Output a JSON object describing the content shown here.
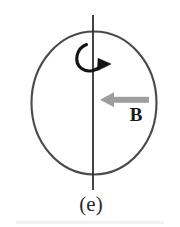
{
  "figure": {
    "panel_label": "(e)",
    "field_label": "B",
    "caption_note": "",
    "colors": {
      "circle_stroke": "#4a4a4a",
      "axis_stroke": "#2e2e2e",
      "rotation_arrow": "#141414",
      "field_arrow": "#9a9a9a",
      "text": "#1a1a1a",
      "background": "#ffffff"
    },
    "icons": {
      "rotation_arrow": "curved-rotation-arrow-icon",
      "field_arrow": "left-pointing-field-arrow-icon",
      "sphere": "circle-outline-icon",
      "axis": "vertical-rotation-axis-icon"
    },
    "geometry": {
      "circle_center_x": 94,
      "circle_center_y": 103,
      "circle_radius_x": 63,
      "circle_radius_y": 72,
      "axis_top_y": 15,
      "axis_bottom_y": 190,
      "axis_x": 93,
      "field_arrow_y": 100,
      "field_arrow_tip_x": 100,
      "field_arrow_tail_x": 149,
      "rotation_arrow_head_x": 110,
      "rotation_arrow_head_y": 63
    }
  }
}
